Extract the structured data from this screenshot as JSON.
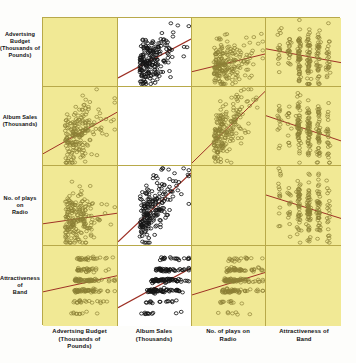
{
  "figure": {
    "type": "scatterplot-matrix",
    "panel_background_highlight": "#f1e995",
    "panel_background_plain": "#ffffff",
    "regression_line_color": "#9d2f24",
    "point_outline_color_dark": "#151515",
    "point_outline_color_olive": "#8c8036",
    "grid_border_color": "#b8a94a"
  },
  "variables": [
    {
      "key": "advert",
      "row_label": [
        "Advertsing Budget",
        "(Thousands of",
        "Pounds)"
      ],
      "col_label": [
        "Advertsing Budget",
        "(Thousands of",
        "Pounds)"
      ]
    },
    {
      "key": "sales",
      "row_label": [
        "Album Sales",
        "(Thousands)"
      ],
      "col_label": [
        "Album Sales",
        "(Thousands)"
      ]
    },
    {
      "key": "radio",
      "row_label": [
        "No. of plays on",
        "Radio"
      ],
      "col_label": [
        "No. of plays on",
        "Radio"
      ]
    },
    {
      "key": "attract",
      "row_label": [
        "Attractiveness of",
        "Band"
      ],
      "col_label": [
        "Attractiveness of",
        "Band"
      ]
    }
  ],
  "chart_data": {
    "type": "scatter",
    "title": "",
    "xlabel": "",
    "ylabel": "",
    "grid": false,
    "legend": "none",
    "matrix_size": 4,
    "variables": [
      "Advertsing Budget (Thousands of Pounds)",
      "Album Sales (Thousands)",
      "No. of plays on Radio",
      "Attractiveness of Band"
    ],
    "panels": [
      {
        "row": 1,
        "col": 1,
        "x": "advert",
        "y": "advert",
        "kind": "diagonal-blank",
        "highlighted": true,
        "points": 0,
        "regression": false
      },
      {
        "row": 1,
        "col": 2,
        "x": "sales",
        "y": "advert",
        "kind": "cloud",
        "highlighted": false,
        "points": 200,
        "regression": true,
        "slope": 0.38,
        "relation": "positive-moderate"
      },
      {
        "row": 1,
        "col": 3,
        "x": "radio",
        "y": "advert",
        "kind": "cloud",
        "highlighted": true,
        "points": 200,
        "regression": true,
        "slope": 0.1,
        "relation": "weak-positive"
      },
      {
        "row": 1,
        "col": 4,
        "x": "attract",
        "y": "advert",
        "kind": "banded-x",
        "highlighted": true,
        "points": 200,
        "regression": true,
        "slope": 0.08,
        "relation": "weak-positive"
      },
      {
        "row": 2,
        "col": 1,
        "x": "advert",
        "y": "sales",
        "kind": "cloud",
        "highlighted": true,
        "points": 200,
        "regression": true,
        "slope": 0.38,
        "relation": "positive-moderate"
      },
      {
        "row": 2,
        "col": 2,
        "x": "sales",
        "y": "sales",
        "kind": "diagonal-blank",
        "highlighted": false,
        "points": 0,
        "regression": false
      },
      {
        "row": 2,
        "col": 3,
        "x": "radio",
        "y": "sales",
        "kind": "cloud",
        "highlighted": true,
        "points": 200,
        "regression": true,
        "slope": 0.6,
        "relation": "positive-strong"
      },
      {
        "row": 2,
        "col": 4,
        "x": "attract",
        "y": "sales",
        "kind": "banded-x",
        "highlighted": true,
        "points": 200,
        "regression": true,
        "slope": 0.33,
        "relation": "positive-moderate"
      },
      {
        "row": 3,
        "col": 1,
        "x": "advert",
        "y": "radio",
        "kind": "cloud",
        "highlighted": true,
        "points": 200,
        "regression": true,
        "slope": 0.1,
        "relation": "weak-positive"
      },
      {
        "row": 3,
        "col": 2,
        "x": "sales",
        "y": "radio",
        "kind": "cloud",
        "highlighted": false,
        "points": 200,
        "regression": true,
        "slope": 0.6,
        "relation": "positive-strong"
      },
      {
        "row": 3,
        "col": 3,
        "x": "radio",
        "y": "radio",
        "kind": "diagonal-blank",
        "highlighted": true,
        "points": 0,
        "regression": false
      },
      {
        "row": 3,
        "col": 4,
        "x": "attract",
        "y": "radio",
        "kind": "banded-x",
        "highlighted": true,
        "points": 200,
        "regression": true,
        "slope": 0.18,
        "relation": "weak-positive"
      },
      {
        "row": 4,
        "col": 1,
        "x": "advert",
        "y": "attract",
        "kind": "banded-y",
        "highlighted": true,
        "points": 200,
        "regression": true,
        "slope": 0.08,
        "relation": "weak-positive"
      },
      {
        "row": 4,
        "col": 2,
        "x": "sales",
        "y": "attract",
        "kind": "banded-y",
        "highlighted": false,
        "points": 200,
        "regression": true,
        "slope": 0.33,
        "relation": "positive-moderate"
      },
      {
        "row": 4,
        "col": 3,
        "x": "radio",
        "y": "attract",
        "kind": "banded-y",
        "highlighted": true,
        "points": 200,
        "regression": true,
        "slope": 0.18,
        "relation": "weak-positive"
      },
      {
        "row": 4,
        "col": 4,
        "x": "attract",
        "y": "attract",
        "kind": "diagonal-blank",
        "highlighted": true,
        "points": 0,
        "regression": false
      }
    ]
  }
}
